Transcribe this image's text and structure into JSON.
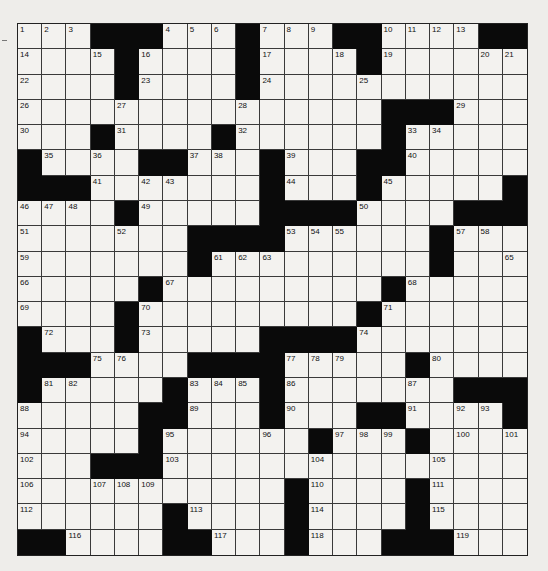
{
  "puzzle": {
    "rows": 21,
    "cols": 21,
    "colors": {
      "block": "#0a0a0a",
      "cell": "#f3f2ef",
      "line": "#3a3a3a",
      "background": "#eeedea"
    },
    "layout": [
      "...###...#...##....##",
      "....#....#....#......",
      "....#....#...........",
      "...............###...",
      "...#....#......#.....",
      "#....##...#...##.....",
      "###.......#...#.....#",
      "....#.....####....###",
      ".......####......#...#",
      ".......#.........#...",
      ".....#.........#.....",
      "....#.........#......",
      "#...#.....####.......",
      "###....####.....#....",
      "#.....#...#.......###",
      ".....##...#...##....#",
      ".....#......#...#....",
      "...###...........,...",
      "...........#....#....",
      "......#....#....#....",
      "##....##...#...###..."
    ],
    "numbers": [
      {
        "r": 0,
        "c": 0,
        "n": 1
      },
      {
        "r": 0,
        "c": 1,
        "n": 2
      },
      {
        "r": 0,
        "c": 2,
        "n": 3
      },
      {
        "r": 0,
        "c": 6,
        "n": 4
      },
      {
        "r": 0,
        "c": 7,
        "n": 5
      },
      {
        "r": 0,
        "c": 8,
        "n": 6
      },
      {
        "r": 0,
        "c": 10,
        "n": 7
      },
      {
        "r": 0,
        "c": 11,
        "n": 8
      },
      {
        "r": 0,
        "c": 12,
        "n": 9
      },
      {
        "r": 0,
        "c": 15,
        "n": 10
      },
      {
        "r": 0,
        "c": 16,
        "n": 11
      },
      {
        "r": 0,
        "c": 17,
        "n": 12
      },
      {
        "r": 0,
        "c": 18,
        "n": 13
      },
      {
        "r": 1,
        "c": 0,
        "n": 14
      },
      {
        "r": 1,
        "c": 3,
        "n": 15
      },
      {
        "r": 1,
        "c": 5,
        "n": 16
      },
      {
        "r": 1,
        "c": 10,
        "n": 17
      },
      {
        "r": 1,
        "c": 13,
        "n": 18
      },
      {
        "r": 1,
        "c": 15,
        "n": 19
      },
      {
        "r": 1,
        "c": 19,
        "n": 20
      },
      {
        "r": 1,
        "c": 20,
        "n": 21
      },
      {
        "r": 2,
        "c": 0,
        "n": 22
      },
      {
        "r": 2,
        "c": 5,
        "n": 23
      },
      {
        "r": 2,
        "c": 10,
        "n": 24
      },
      {
        "r": 2,
        "c": 14,
        "n": 25
      },
      {
        "r": 3,
        "c": 0,
        "n": 26
      },
      {
        "r": 3,
        "c": 4,
        "n": 27
      },
      {
        "r": 3,
        "c": 9,
        "n": 28
      },
      {
        "r": 3,
        "c": 18,
        "n": 29
      },
      {
        "r": 4,
        "c": 0,
        "n": 30
      },
      {
        "r": 4,
        "c": 4,
        "n": 31
      },
      {
        "r": 4,
        "c": 9,
        "n": 32
      },
      {
        "r": 4,
        "c": 16,
        "n": 33
      },
      {
        "r": 4,
        "c": 17,
        "n": 34
      },
      {
        "r": 5,
        "c": 1,
        "n": 35
      },
      {
        "r": 5,
        "c": 3,
        "n": 36
      },
      {
        "r": 5,
        "c": 7,
        "n": 37
      },
      {
        "r": 5,
        "c": 8,
        "n": 38
      },
      {
        "r": 5,
        "c": 11,
        "n": 39
      },
      {
        "r": 5,
        "c": 16,
        "n": 40
      },
      {
        "r": 6,
        "c": 3,
        "n": 41
      },
      {
        "r": 6,
        "c": 5,
        "n": 42
      },
      {
        "r": 6,
        "c": 6,
        "n": 43
      },
      {
        "r": 6,
        "c": 11,
        "n": 44
      },
      {
        "r": 6,
        "c": 15,
        "n": 45
      },
      {
        "r": 7,
        "c": 0,
        "n": 46
      },
      {
        "r": 7,
        "c": 1,
        "n": 47
      },
      {
        "r": 7,
        "c": 2,
        "n": 48
      },
      {
        "r": 7,
        "c": 5,
        "n": 49
      },
      {
        "r": 7,
        "c": 14,
        "n": 50
      },
      {
        "r": 8,
        "c": 0,
        "n": 51
      },
      {
        "r": 8,
        "c": 4,
        "n": 52
      },
      {
        "r": 8,
        "c": 11,
        "n": 53
      },
      {
        "r": 8,
        "c": 12,
        "n": 54
      },
      {
        "r": 8,
        "c": 13,
        "n": 55
      },
      {
        "r": 8,
        "c": 17,
        "n": 56
      },
      {
        "r": 8,
        "c": 18,
        "n": 57
      },
      {
        "r": 8,
        "c": 19,
        "n": 58
      },
      {
        "r": 9,
        "c": 0,
        "n": 59
      },
      {
        "r": 9,
        "c": 7,
        "n": 60
      },
      {
        "r": 9,
        "c": 8,
        "n": 61
      },
      {
        "r": 9,
        "c": 9,
        "n": 62
      },
      {
        "r": 9,
        "c": 10,
        "n": 63
      },
      {
        "r": 9,
        "c": 17,
        "n": 64
      },
      {
        "r": 9,
        "c": 20,
        "n": 65
      },
      {
        "r": 10,
        "c": 0,
        "n": 66
      },
      {
        "r": 10,
        "c": 6,
        "n": 67
      },
      {
        "r": 10,
        "c": 16,
        "n": 68
      },
      {
        "r": 11,
        "c": 0,
        "n": 69
      },
      {
        "r": 11,
        "c": 5,
        "n": 70
      },
      {
        "r": 11,
        "c": 15,
        "n": 71
      },
      {
        "r": 12,
        "c": 1,
        "n": 72
      },
      {
        "r": 12,
        "c": 5,
        "n": 73
      },
      {
        "r": 12,
        "c": 14,
        "n": 74
      },
      {
        "r": 13,
        "c": 3,
        "n": 75
      },
      {
        "r": 13,
        "c": 4,
        "n": 76
      },
      {
        "r": 13,
        "c": 11,
        "n": 77
      },
      {
        "r": 13,
        "c": 12,
        "n": 78
      },
      {
        "r": 13,
        "c": 13,
        "n": 79
      },
      {
        "r": 13,
        "c": 17,
        "n": 80
      },
      {
        "r": 14,
        "c": 1,
        "n": 81
      },
      {
        "r": 14,
        "c": 2,
        "n": 82
      },
      {
        "r": 14,
        "c": 7,
        "n": 83
      },
      {
        "r": 14,
        "c": 8,
        "n": 84
      },
      {
        "r": 14,
        "c": 9,
        "n": 85
      },
      {
        "r": 14,
        "c": 11,
        "n": 86
      },
      {
        "r": 14,
        "c": 16,
        "n": 87
      },
      {
        "r": 15,
        "c": 0,
        "n": 88
      },
      {
        "r": 15,
        "c": 7,
        "n": 89
      },
      {
        "r": 15,
        "c": 11,
        "n": 90
      },
      {
        "r": 15,
        "c": 16,
        "n": 91
      },
      {
        "r": 15,
        "c": 18,
        "n": 92
      },
      {
        "r": 15,
        "c": 19,
        "n": 93
      },
      {
        "r": 16,
        "c": 0,
        "n": 94
      },
      {
        "r": 16,
        "c": 6,
        "n": 95
      },
      {
        "r": 16,
        "c": 10,
        "n": 96
      },
      {
        "r": 16,
        "c": 13,
        "n": 97
      },
      {
        "r": 16,
        "c": 14,
        "n": 98
      },
      {
        "r": 16,
        "c": 15,
        "n": 99
      },
      {
        "r": 16,
        "c": 18,
        "n": 100
      },
      {
        "r": 16,
        "c": 20,
        "n": 101
      },
      {
        "r": 17,
        "c": 0,
        "n": 102
      },
      {
        "r": 17,
        "c": 6,
        "n": 103
      },
      {
        "r": 17,
        "c": 12,
        "n": 104
      },
      {
        "r": 17,
        "c": 17,
        "n": 105
      },
      {
        "r": 18,
        "c": 0,
        "n": 106
      },
      {
        "r": 18,
        "c": 3,
        "n": 107
      },
      {
        "r": 18,
        "c": 4,
        "n": 108
      },
      {
        "r": 18,
        "c": 5,
        "n": 109
      },
      {
        "r": 18,
        "c": 12,
        "n": 110
      },
      {
        "r": 18,
        "c": 17,
        "n": 111
      },
      {
        "r": 19,
        "c": 0,
        "n": 112
      },
      {
        "r": 19,
        "c": 7,
        "n": 113
      },
      {
        "r": 19,
        "c": 12,
        "n": 114
      },
      {
        "r": 19,
        "c": 17,
        "n": 115
      },
      {
        "r": 20,
        "c": 2,
        "n": 116
      },
      {
        "r": 20,
        "c": 8,
        "n": 117
      },
      {
        "r": 20,
        "c": 12,
        "n": 118
      },
      {
        "r": 20,
        "c": 18,
        "n": 119
      }
    ],
    "marks": [
      {
        "r": 4,
        "c": 8,
        "glyph": "c",
        "note": "small smudge mark near cell corner"
      }
    ]
  }
}
